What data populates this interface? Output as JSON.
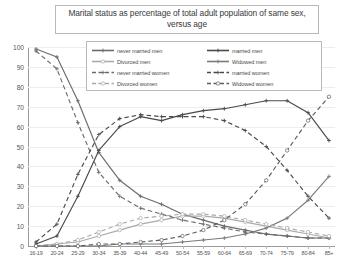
{
  "chart_data": {
    "type": "line",
    "title": "Marital status as percentage of total adult population of same sex, versus age",
    "xlabel": "",
    "ylabel": "",
    "ylim": [
      0,
      100
    ],
    "ytick_step": 10,
    "yticks": [
      "0",
      "10",
      "20",
      "30",
      "40",
      "50",
      "60",
      "70",
      "80",
      "90",
      "100"
    ],
    "grid": true,
    "legend_position": "top-center-inside",
    "categories": [
      "16-19",
      "20-24",
      "25-29",
      "30-34",
      "35-39",
      "40-44",
      "45-49",
      "50-54",
      "55-59",
      "60-64",
      "65-69",
      "70-74",
      "75-79",
      "80-84",
      "85+"
    ],
    "series": [
      {
        "name": "never married men",
        "style": "solid",
        "color": "#6b6b6b",
        "marker": "plus",
        "values": [
          99,
          95,
          73,
          47,
          33,
          25,
          21,
          16,
          13,
          10,
          8,
          6,
          5,
          4,
          4
        ]
      },
      {
        "name": "married men",
        "style": "solid",
        "color": "#4a4a4a",
        "marker": "plus",
        "values": [
          1,
          5,
          25,
          48,
          60,
          65,
          63,
          66,
          68,
          69,
          71,
          73,
          73,
          67,
          53
        ]
      },
      {
        "name": "Divorced men",
        "style": "solid",
        "color": "#aaaaaa",
        "marker": "circle",
        "values": [
          0,
          1,
          2,
          5,
          8,
          11,
          13,
          15,
          15,
          14,
          12,
          10,
          8,
          6,
          4
        ]
      },
      {
        "name": "Widowed men",
        "style": "solid",
        "color": "#7a7a7a",
        "marker": "plus",
        "values": [
          0,
          0,
          0,
          0,
          1,
          1,
          1,
          2,
          3,
          4,
          6,
          9,
          14,
          23,
          35
        ]
      },
      {
        "name": "never married women",
        "style": "dashed",
        "color": "#6b6b6b",
        "marker": "plus",
        "values": [
          98,
          89,
          62,
          37,
          25,
          19,
          16,
          13,
          11,
          9,
          7,
          6,
          5,
          4,
          4
        ]
      },
      {
        "name": "married women",
        "style": "dashed",
        "color": "#4a4a4a",
        "marker": "plus",
        "values": [
          2,
          11,
          36,
          56,
          64,
          66,
          65,
          65,
          65,
          63,
          58,
          50,
          38,
          25,
          14
        ]
      },
      {
        "name": "Divorced women",
        "style": "dashed",
        "color": "#aaaaaa",
        "marker": "circle",
        "values": [
          0,
          1,
          3,
          7,
          11,
          14,
          15,
          16,
          16,
          15,
          13,
          11,
          9,
          7,
          5
        ]
      },
      {
        "name": "Widowed women",
        "style": "dashed",
        "color": "#5c5c5c",
        "marker": "circle",
        "values": [
          0,
          0,
          0,
          1,
          1,
          2,
          3,
          5,
          8,
          13,
          21,
          33,
          48,
          63,
          75
        ]
      }
    ]
  }
}
